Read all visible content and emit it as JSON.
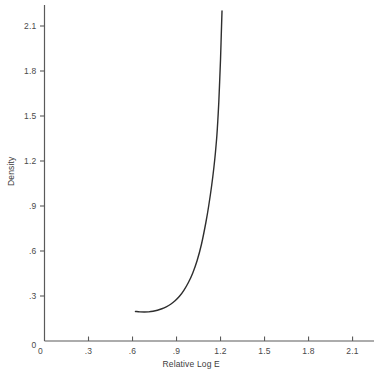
{
  "chart_data": {
    "type": "line",
    "title": "",
    "xlabel": "Relative Log E",
    "ylabel": "Density",
    "xlim": [
      0,
      2.25
    ],
    "ylim": [
      0,
      2.25
    ],
    "grid": false,
    "legend": "none",
    "xticks": [
      "0",
      ".3",
      ".6",
      ".9",
      "1.2",
      "1.5",
      "1.8",
      "2.1"
    ],
    "xtick_values": [
      0,
      0.3,
      0.6,
      0.9,
      1.2,
      1.5,
      1.8,
      2.1
    ],
    "yticks": [
      "0",
      ".3",
      ".6",
      ".9",
      "1.2",
      "1.5",
      "1.8",
      "2.1"
    ],
    "ytick_values": [
      0,
      0.3,
      0.6,
      0.9,
      1.2,
      1.5,
      1.8,
      2.1
    ],
    "series": [
      {
        "name": "characteristic-curve",
        "color": "#2e2e2e",
        "x": [
          0.62,
          0.65,
          0.68,
          0.71,
          0.74,
          0.77,
          0.8,
          0.83,
          0.86,
          0.89,
          0.92,
          0.95,
          0.98,
          1.01,
          1.04,
          1.07,
          1.1,
          1.12,
          1.14,
          1.155,
          1.165,
          1.175,
          1.182,
          1.188,
          1.194,
          1.2,
          1.205,
          1.21
        ],
        "y": [
          0.197,
          0.194,
          0.193,
          0.194,
          0.198,
          0.205,
          0.215,
          0.228,
          0.245,
          0.268,
          0.298,
          0.338,
          0.388,
          0.452,
          0.535,
          0.645,
          0.79,
          0.905,
          1.04,
          1.16,
          1.255,
          1.37,
          1.48,
          1.59,
          1.73,
          1.88,
          2.04,
          2.2
        ]
      }
    ]
  },
  "axes": {
    "x_origin_label": "0",
    "y_origin_label": "0"
  }
}
